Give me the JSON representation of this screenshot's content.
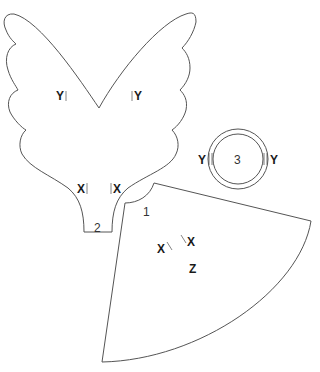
{
  "diagram": {
    "title": "",
    "pieces": [
      {
        "id": "1",
        "label": "1",
        "shape": "cone-sector"
      },
      {
        "id": "2",
        "label": "2",
        "shape": "wings"
      },
      {
        "id": "3",
        "label": "3",
        "shape": "ring"
      }
    ],
    "marks": {
      "wing_left_y": "Y|",
      "wing_right_y": "|Y",
      "wing_left_x": "X|",
      "wing_right_x": "|X",
      "ring_left_y": "Y",
      "ring_right_y": "Y",
      "cone_left_x": "X\\",
      "cone_right_x": "\\X",
      "cone_z": "Z"
    },
    "colors": {
      "line": "#555555",
      "text": "#1a1a1a",
      "background": "#ffffff"
    }
  }
}
